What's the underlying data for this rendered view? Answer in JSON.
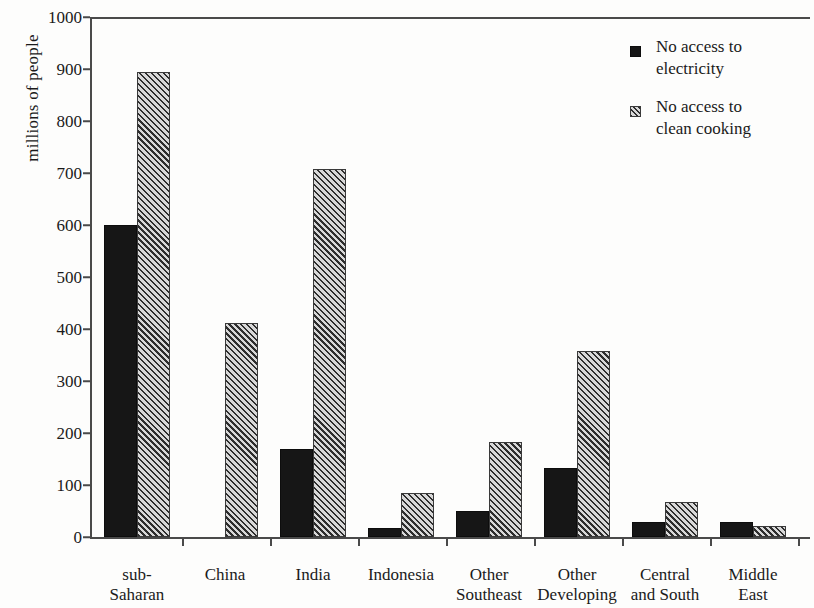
{
  "chart_data": {
    "type": "bar",
    "title": "",
    "xlabel": "",
    "ylabel": "millions of people",
    "ylim": [
      0,
      1000
    ],
    "ytick_step": 100,
    "yticks": [
      0,
      100,
      200,
      300,
      400,
      500,
      600,
      700,
      800,
      900,
      1000
    ],
    "ytick_labels": [
      "0",
      "100",
      "200",
      "300",
      "400",
      "500",
      "600",
      "700",
      "800",
      "900",
      "1000"
    ],
    "grid": false,
    "legend_position": "top-right",
    "categories": [
      "sub-\nSaharan\nAfrica",
      "China",
      "India",
      "Indonesia",
      "Other\nSoutheast\nAsia",
      "Other\nDeveloping\nAsia",
      "Central\nand South\nAmerica",
      "Middle\nEast"
    ],
    "series": [
      {
        "name": "No access to electricity",
        "label_line1": "No access to",
        "label_line2": "electricity",
        "color": "#161616",
        "pattern": "solid",
        "values": [
          600,
          0,
          170,
          17,
          50,
          133,
          28,
          28
        ]
      },
      {
        "name": "No access to clean cooking",
        "label_line1": "No access to",
        "label_line2": "clean cooking",
        "color": "#c9c9c9",
        "pattern": "diagonal-hatch",
        "values": [
          895,
          412,
          708,
          85,
          183,
          357,
          67,
          21
        ]
      }
    ]
  }
}
